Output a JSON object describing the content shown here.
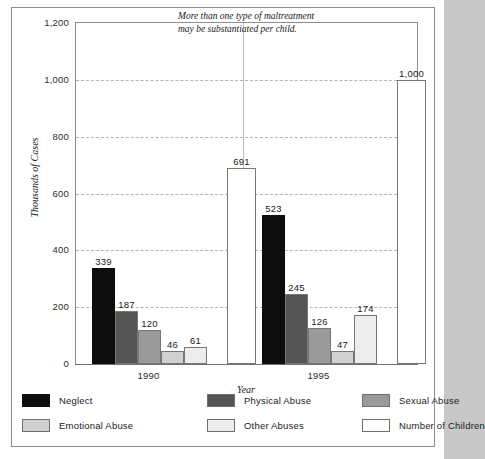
{
  "annotation": {
    "line1": "More than one type of maltreatment",
    "line2": "may be substantiated per child."
  },
  "axes": {
    "y_title": "Thousands of Cases",
    "x_title": "Year",
    "y_ticks": [
      "0",
      "200",
      "400",
      "600",
      "800",
      "1,000",
      "1,200"
    ]
  },
  "legend": {
    "items": [
      {
        "label": "Neglect",
        "color": "#0d0d0d"
      },
      {
        "label": "Physical Abuse",
        "color": "#555555"
      },
      {
        "label": "Sexual Abuse",
        "color": "#9a9a9a"
      },
      {
        "label": "Emotional Abuse",
        "color": "#d0d0d0"
      },
      {
        "label": "Other Abuses",
        "color": "#ededed"
      },
      {
        "label": "Number of Children",
        "color": "#ffffff"
      }
    ]
  },
  "chart_data": {
    "type": "bar",
    "title": "",
    "xlabel": "Year",
    "ylabel": "Thousands of Cases",
    "ylim": [
      0,
      1200
    ],
    "ytick_step": 200,
    "grid": true,
    "legend_position": "bottom",
    "categories": [
      "1990",
      "1995"
    ],
    "series": [
      {
        "name": "Neglect",
        "color": "#0d0d0d",
        "values": [
          339,
          523
        ]
      },
      {
        "name": "Physical Abuse",
        "color": "#555555",
        "values": [
          187,
          245
        ]
      },
      {
        "name": "Sexual Abuse",
        "color": "#9a9a9a",
        "values": [
          120,
          126
        ]
      },
      {
        "name": "Emotional Abuse",
        "color": "#d0d0d0",
        "values": [
          46,
          47
        ]
      },
      {
        "name": "Other Abuses",
        "color": "#ededed",
        "values": [
          61,
          174
        ]
      },
      {
        "name": "Number of Children",
        "color": "#ffffff",
        "values": [
          691,
          1000
        ]
      }
    ],
    "value_labels": {
      "1990": [
        "339",
        "187",
        "120",
        "46",
        "61",
        "691"
      ],
      "1995": [
        "523",
        "245",
        "126",
        "47",
        "174",
        "1,000"
      ]
    },
    "annotation": "More than one type of maltreatment may be substantiated per child."
  }
}
